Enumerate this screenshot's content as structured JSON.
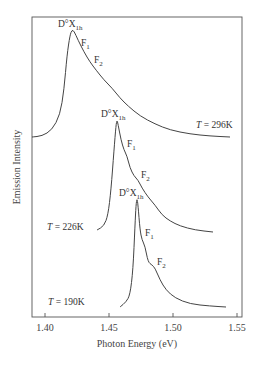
{
  "chart_data": {
    "type": "line",
    "title": "",
    "xlabel": "Photon Energy (eV)",
    "ylabel": "Emission Intensity",
    "xlim": [
      1.385,
      1.553
    ],
    "x_ticks": [
      1.4,
      1.45,
      1.5,
      1.55
    ],
    "x_tick_labels": [
      "1.40",
      "1.45",
      "1.50",
      "1.55"
    ],
    "grid": false,
    "legend": "none",
    "series": [
      {
        "name": "T = 296K",
        "label": "T = 296K",
        "peak_energy": 1.421,
        "points_px": [
          [
            32,
            137
          ],
          [
            42,
            136
          ],
          [
            52,
            130
          ],
          [
            60,
            115
          ],
          [
            64,
            90
          ],
          [
            67,
            55
          ],
          [
            70,
            35
          ],
          [
            72,
            30
          ],
          [
            74,
            31
          ],
          [
            78,
            40
          ],
          [
            84,
            52
          ],
          [
            90,
            62
          ],
          [
            96,
            70
          ],
          [
            104,
            80
          ],
          [
            112,
            88
          ],
          [
            120,
            98
          ],
          [
            128,
            106
          ],
          [
            140,
            116
          ],
          [
            155,
            124
          ],
          [
            170,
            130
          ],
          [
            190,
            134
          ],
          [
            210,
            136
          ],
          [
            230,
            137
          ]
        ]
      },
      {
        "name": "T = 226K",
        "label": "T = 226K",
        "peak_energy": 1.456,
        "points_px": [
          [
            97,
            230
          ],
          [
            104,
            226
          ],
          [
            108,
            215
          ],
          [
            111,
            190
          ],
          [
            114,
            150
          ],
          [
            116,
            125
          ],
          [
            117,
            120
          ],
          [
            118,
            124
          ],
          [
            121,
            140
          ],
          [
            124,
            150
          ],
          [
            127,
            156
          ],
          [
            130,
            168
          ],
          [
            134,
            176
          ],
          [
            138,
            180
          ],
          [
            142,
            188
          ],
          [
            148,
            197
          ],
          [
            155,
            205
          ],
          [
            162,
            215
          ],
          [
            170,
            221
          ],
          [
            180,
            226
          ],
          [
            195,
            230
          ],
          [
            213,
            232
          ]
        ]
      },
      {
        "name": "T = 190K",
        "label": "T = 190K",
        "peak_energy": 1.471,
        "points_px": [
          [
            120,
            307
          ],
          [
            126,
            302
          ],
          [
            130,
            295
          ],
          [
            133,
            270
          ],
          [
            135,
            225
          ],
          [
            136,
            205
          ],
          [
            137,
            198
          ],
          [
            138,
            205
          ],
          [
            140,
            230
          ],
          [
            142,
            240
          ],
          [
            145,
            246
          ],
          [
            148,
            262
          ],
          [
            152,
            265
          ],
          [
            155,
            268
          ],
          [
            160,
            280
          ],
          [
            166,
            290
          ],
          [
            175,
            298
          ],
          [
            190,
            304
          ],
          [
            210,
            306
          ],
          [
            226,
            307
          ]
        ]
      }
    ],
    "annotations": [
      {
        "text_main": "D°X",
        "text_sub": "1h",
        "series": "T = 296K",
        "x": 58,
        "y": 27
      },
      {
        "text_main": "F",
        "text_sub": "1",
        "series": "T = 296K",
        "x": 81,
        "y": 46
      },
      {
        "text_main": "F",
        "text_sub": "2",
        "series": "T = 296K",
        "x": 94,
        "y": 63
      },
      {
        "text_main": "D°X",
        "text_sub": "1h",
        "series": "T = 226K",
        "x": 101,
        "y": 117
      },
      {
        "text_main": "F",
        "text_sub": "1",
        "series": "T = 226K",
        "x": 127,
        "y": 147
      },
      {
        "text_main": "F",
        "text_sub": "2",
        "series": "T = 226K",
        "x": 141,
        "y": 178
      },
      {
        "text_main": "D°X",
        "text_sub": "1h",
        "series": "T = 190K",
        "x": 119,
        "y": 196
      },
      {
        "text_main": "F",
        "text_sub": "1",
        "series": "T = 190K",
        "x": 145,
        "y": 236
      },
      {
        "text_main": "F",
        "text_sub": "2",
        "series": "T = 190K",
        "x": 157,
        "y": 265
      }
    ],
    "temperature_labels": [
      {
        "T": "T",
        "rest": " = 296K",
        "x": 196,
        "y": 128
      },
      {
        "T": "T",
        "rest": " = 226K",
        "x": 47,
        "y": 230
      },
      {
        "T": "T",
        "rest": " = 190K",
        "x": 48,
        "y": 305
      }
    ]
  }
}
